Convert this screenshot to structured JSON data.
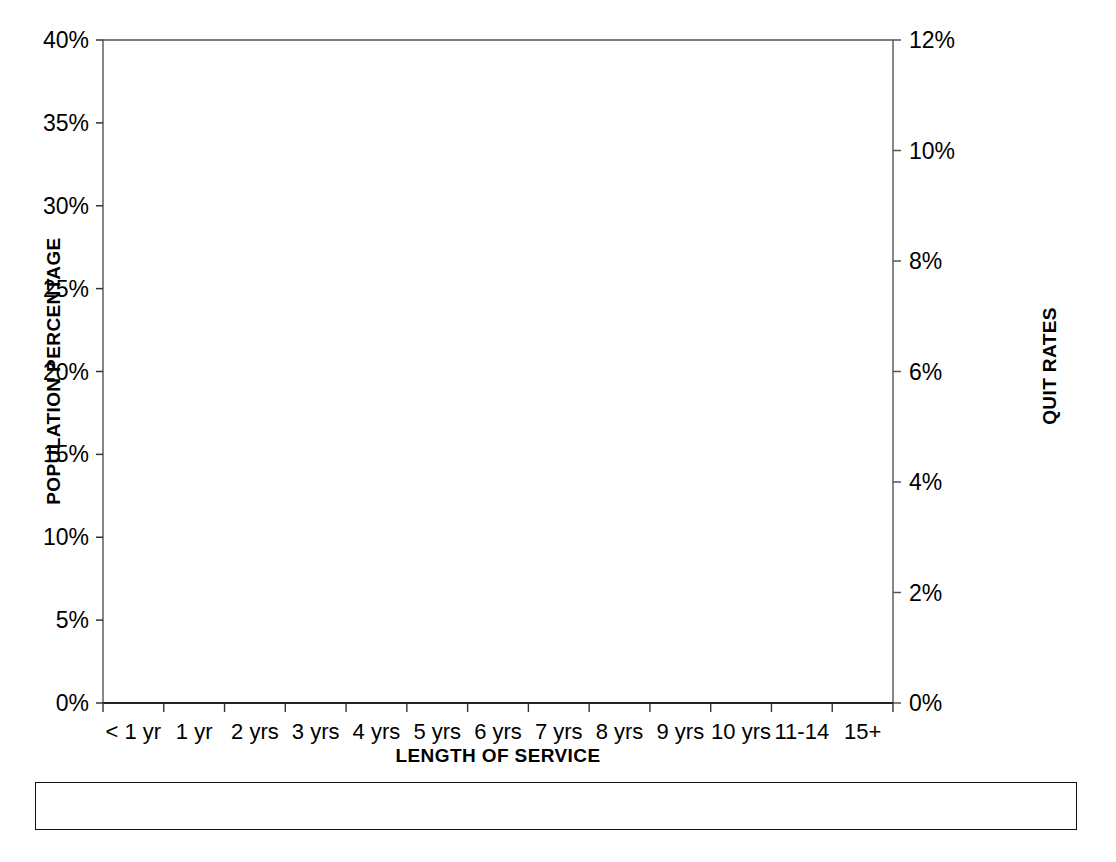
{
  "chart_data": {
    "type": "bar",
    "title": "",
    "xlabel": "LENGTH OF SERVICE",
    "ylabel": "POPULATION PERCENTAGE",
    "y2label": "QUIT RATES",
    "categories": [
      "< 1 yr",
      "1 yr",
      "2 yrs",
      "3 yrs",
      "4 yrs",
      "5 yrs",
      "6 yrs",
      "7 yrs",
      "8 yrs",
      "9 yrs",
      "10 yrs",
      "11-14",
      "15+"
    ],
    "ylim": [
      0,
      40
    ],
    "y2lim": [
      0,
      12
    ],
    "yticks": [
      "0%",
      "5%",
      "10%",
      "15%",
      "20%",
      "25%",
      "30%",
      "35%",
      "40%"
    ],
    "y2ticks": [
      "0%",
      "2%",
      "4%",
      "6%",
      "8%",
      "10%",
      "12%"
    ],
    "grid": false,
    "legend_position": "bottom",
    "series": [
      {
        "name": "PERCENT MEN",
        "kind": "bar",
        "axis": "left",
        "style": "open",
        "values": [
          5.1,
          5.2,
          6.6,
          8.6,
          6.2,
          5.0,
          5.1,
          4.1,
          3.8,
          2.7,
          2.2,
          9.5,
          38.3
        ]
      },
      {
        "name": "PERCENT WOMEN",
        "kind": "bar",
        "axis": "left",
        "style": "hatched",
        "values": [
          5.9,
          4.9,
          7.3,
          9.7,
          6.8,
          6.3,
          5.6,
          4.5,
          4.4,
          3.2,
          2.3,
          10.6,
          30.8
        ]
      },
      {
        "name": "MEN QUIT RATE",
        "kind": "line",
        "axis": "right",
        "style": "solid-square",
        "values": [
          6.2,
          7.3,
          7.25,
          5.15,
          4.4,
          5.1,
          3.35,
          3.3,
          2.95,
          2.85,
          2.3,
          2.05,
          1.15
        ]
      },
      {
        "name": "WOMEN QUIT RATE",
        "kind": "line",
        "axis": "right",
        "style": "dashed-triangle",
        "values": [
          8.7,
          9.6,
          11.0,
          8.0,
          5.9,
          6.3,
          5.1,
          4.6,
          3.95,
          4.55,
          3.35,
          3.1,
          1.4
        ]
      }
    ]
  },
  "axes": {
    "left_title": "POPULATION PERCENTAGE",
    "right_title": "QUIT RATES",
    "bottom_title": "LENGTH OF SERVICE"
  },
  "legend": {
    "items": [
      {
        "label": "PERCENT MEN",
        "icon": "open-bar-swatch"
      },
      {
        "label": "PERCENT WOMEN",
        "icon": "hatched-bar-swatch"
      },
      {
        "label": "MEN QUIT RATE",
        "icon": "solid-line-square-marker"
      },
      {
        "label": "WOMEN QUIT RATE",
        "icon": "dashed-line-triangle-marker"
      }
    ]
  },
  "colors": {
    "foreground": "#000000",
    "background": "#ffffff",
    "axis": "#444444"
  }
}
